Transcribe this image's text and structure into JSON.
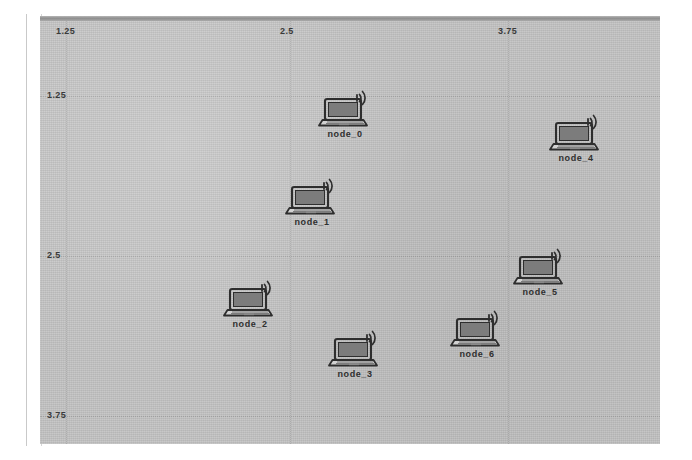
{
  "app": {
    "title": "NetAnim Wireless Topology Animation"
  },
  "canvas": {
    "background_color": "#c3c3c3",
    "frame_color": "#8e8e8e",
    "gridline_color": "#9a9a9a"
  },
  "axes": {
    "x_ticks": [
      {
        "label": "1.25",
        "x": 26
      },
      {
        "label": "2.5",
        "x": 250
      },
      {
        "label": "3.75",
        "x": 468
      }
    ],
    "y_ticks": [
      {
        "label": "1.25",
        "y": 80
      },
      {
        "label": "2.5",
        "y": 240
      },
      {
        "label": "3.75",
        "y": 400
      }
    ]
  },
  "nodes": [
    {
      "id": "node_0",
      "label": "node_0",
      "x": 305,
      "y": 100,
      "icon": "wireless-laptop-icon"
    },
    {
      "id": "node_1",
      "label": "node_1",
      "x": 272,
      "y": 188,
      "icon": "wireless-laptop-icon"
    },
    {
      "id": "node_2",
      "label": "node_2",
      "x": 210,
      "y": 290,
      "icon": "wireless-laptop-icon"
    },
    {
      "id": "node_3",
      "label": "node_3",
      "x": 315,
      "y": 340,
      "icon": "wireless-laptop-icon"
    },
    {
      "id": "node_4",
      "label": "node_4",
      "x": 536,
      "y": 124,
      "icon": "wireless-laptop-icon"
    },
    {
      "id": "node_5",
      "label": "node_5",
      "x": 500,
      "y": 258,
      "icon": "wireless-laptop-icon"
    },
    {
      "id": "node_6",
      "label": "node_6",
      "x": 437,
      "y": 320,
      "icon": "wireless-laptop-icon"
    }
  ]
}
